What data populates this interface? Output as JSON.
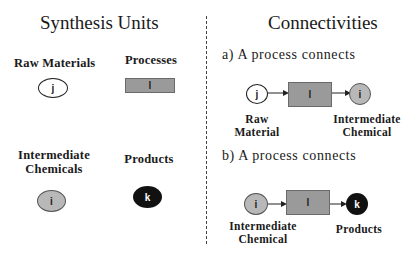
{
  "left_panel": {
    "title": "Synthesis Units",
    "units": [
      {
        "label": "Raw Materials",
        "symbol": "j",
        "shape": "white-circle"
      },
      {
        "label": "Processes",
        "symbol": "l",
        "shape": "gray-rectangle"
      },
      {
        "label_line1": "Intermediate",
        "label_line2": "Chemicals",
        "symbol": "i",
        "shape": "gray-circle"
      },
      {
        "label": "Products",
        "symbol": "k",
        "shape": "black-circle"
      }
    ]
  },
  "right_panel": {
    "title": "Connectivities",
    "case_a": {
      "heading": "a) A process connects",
      "from": {
        "symbol": "j",
        "label_line1": "Raw",
        "label_line2": "Material"
      },
      "process": {
        "symbol": "l"
      },
      "to": {
        "symbol": "i",
        "label_line1": "Intermediate",
        "label_line2": "Chemical"
      }
    },
    "case_b": {
      "heading": "b) A process connects",
      "from": {
        "symbol": "i",
        "label_line1": "Intermediate",
        "label_line2": "Chemical"
      },
      "process": {
        "symbol": "l"
      },
      "to": {
        "symbol": "k",
        "label": "Products"
      }
    }
  },
  "colors": {
    "raw_material_fill": "#ffffff",
    "intermediate_fill": "#b8b8b8",
    "product_fill": "#111111",
    "process_fill": "#9a9a9a"
  }
}
